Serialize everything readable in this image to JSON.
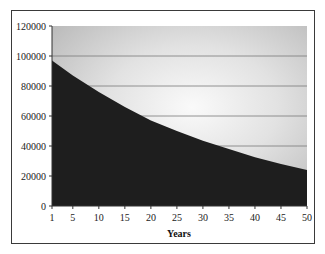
{
  "chart_data": {
    "type": "area",
    "title": "",
    "xlabel": "Years",
    "ylabel": "",
    "xlim": [
      1,
      50
    ],
    "ylim": [
      0,
      120000
    ],
    "x_ticks": [
      "1",
      "5",
      "10",
      "15",
      "20",
      "25",
      "30",
      "35",
      "40",
      "45",
      "50"
    ],
    "y_ticks": [
      "0",
      "20000",
      "40000",
      "60000",
      "80000",
      "100000",
      "120000"
    ],
    "grid": {
      "horizontal": true,
      "vertical": false
    },
    "legend": null,
    "series": [
      {
        "name": "Value",
        "color": "#1e1e1e",
        "x": [
          1,
          5,
          10,
          15,
          20,
          25,
          30,
          35,
          40,
          45,
          50
        ],
        "values": [
          97000,
          87000,
          76000,
          66000,
          57000,
          50000,
          43500,
          38000,
          32500,
          28000,
          24000
        ]
      }
    ],
    "colors": {
      "area_fill": "#1e1e1e",
      "plot_background_edge": "#b9b9b9",
      "plot_background_center": "#fafafa",
      "gridline": "#7a7a7a"
    }
  }
}
